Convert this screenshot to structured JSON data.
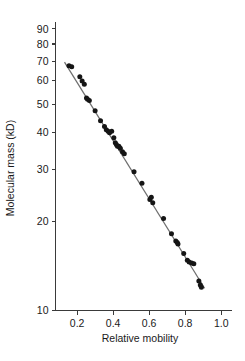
{
  "chart_data": {
    "type": "scatter",
    "title": "",
    "subtitle": "",
    "xlabel": "Relative mobility",
    "ylabel": "Molecular mass (kD)",
    "xlim": [
      0.08,
      1.06
    ],
    "ylim": [
      10,
      95
    ],
    "yscale": "log",
    "xscale": "linear",
    "grid": false,
    "legend": null,
    "xticks": [
      0.2,
      0.4,
      0.6,
      0.8,
      1.0
    ],
    "xticklabels": [
      "0.2",
      "0.4",
      "0.6",
      "0.8",
      "1.0"
    ],
    "yticks": [
      10,
      20,
      30,
      40,
      50,
      60,
      70,
      80,
      90
    ],
    "yticklabels": [
      "10",
      "20",
      "30",
      "40",
      "50",
      "60",
      "70",
      "80",
      "90"
    ],
    "series": [
      {
        "name": "protein standards",
        "marker": "filled-circle",
        "color": "#151515",
        "points": [
          {
            "x": 0.155,
            "y": 67.5
          },
          {
            "x": 0.17,
            "y": 67.0
          },
          {
            "x": 0.215,
            "y": 62.0
          },
          {
            "x": 0.228,
            "y": 60.0
          },
          {
            "x": 0.24,
            "y": 58.5
          },
          {
            "x": 0.252,
            "y": 52.5
          },
          {
            "x": 0.258,
            "y": 52.0
          },
          {
            "x": 0.268,
            "y": 51.5
          },
          {
            "x": 0.3,
            "y": 47.5
          },
          {
            "x": 0.33,
            "y": 44.0
          },
          {
            "x": 0.352,
            "y": 42.0
          },
          {
            "x": 0.362,
            "y": 41.0
          },
          {
            "x": 0.372,
            "y": 40.5
          },
          {
            "x": 0.38,
            "y": 40.0
          },
          {
            "x": 0.392,
            "y": 40.5
          },
          {
            "x": 0.404,
            "y": 38.5
          },
          {
            "x": 0.412,
            "y": 37.0
          },
          {
            "x": 0.418,
            "y": 36.5
          },
          {
            "x": 0.424,
            "y": 36.0
          },
          {
            "x": 0.432,
            "y": 36.0
          },
          {
            "x": 0.44,
            "y": 35.5
          },
          {
            "x": 0.452,
            "y": 34.5
          },
          {
            "x": 0.462,
            "y": 34.0
          },
          {
            "x": 0.516,
            "y": 29.5
          },
          {
            "x": 0.56,
            "y": 27.0
          },
          {
            "x": 0.604,
            "y": 23.8
          },
          {
            "x": 0.612,
            "y": 24.2
          },
          {
            "x": 0.62,
            "y": 23.2
          },
          {
            "x": 0.68,
            "y": 20.5
          },
          {
            "x": 0.724,
            "y": 18.2
          },
          {
            "x": 0.748,
            "y": 17.2
          },
          {
            "x": 0.756,
            "y": 17.0
          },
          {
            "x": 0.76,
            "y": 16.8
          },
          {
            "x": 0.792,
            "y": 15.6
          },
          {
            "x": 0.812,
            "y": 14.8
          },
          {
            "x": 0.822,
            "y": 14.6
          },
          {
            "x": 0.836,
            "y": 14.5
          },
          {
            "x": 0.848,
            "y": 14.4
          },
          {
            "x": 0.876,
            "y": 12.6
          },
          {
            "x": 0.884,
            "y": 12.2
          },
          {
            "x": 0.89,
            "y": 12.0
          }
        ]
      }
    ],
    "fit_line": {
      "name": "standard curve",
      "color": "#6f6f6f",
      "x_start": 0.13,
      "y_start": 69.5,
      "x_end": 0.908,
      "y_end": 11.9
    }
  }
}
